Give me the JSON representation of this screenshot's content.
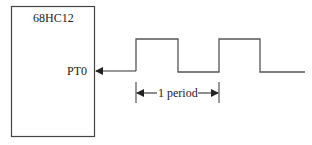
{
  "diagram": {
    "chip": {
      "label": "68HC12"
    },
    "pin": {
      "label": "PT0"
    },
    "waveform": {
      "type": "square-wave",
      "direction": "input-to-pin"
    },
    "period_marker": {
      "label": "1 period"
    }
  },
  "colors": {
    "line": "#333333",
    "text": "#1a1a1a",
    "background": "#ffffff"
  }
}
